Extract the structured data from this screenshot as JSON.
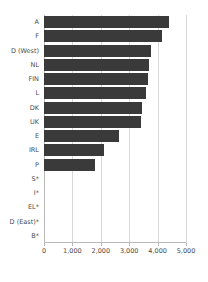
{
  "chart_data": {
    "type": "bar",
    "orientation": "horizontal",
    "title": "",
    "xlabel": "",
    "ylabel": "",
    "xlim": [
      0,
      5000
    ],
    "xticks": [
      0,
      1000,
      2000,
      3000,
      4000,
      5000
    ],
    "xtick_labels": [
      "0",
      "1,000",
      "2,000",
      "3,000",
      "4,000",
      "5,000"
    ],
    "grid": true,
    "legend": "none",
    "bar_color": "#3a3a3a",
    "categories": [
      "A",
      "F",
      "D (West)",
      "NL",
      "FIN",
      "L",
      "DK",
      "UK",
      "E",
      "IRL",
      "P",
      "S*",
      "I*",
      "EL*",
      "D (East)*",
      "B*"
    ],
    "values": [
      4400,
      4150,
      3750,
      3700,
      3650,
      3600,
      3450,
      3400,
      2650,
      2100,
      1800,
      0,
      0,
      0,
      0,
      0
    ]
  }
}
